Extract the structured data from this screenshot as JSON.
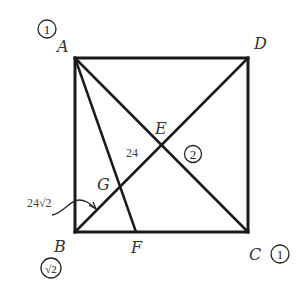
{
  "diagram": {
    "stroke_color": "#1a1a1a",
    "points": {
      "A": {
        "label": "A",
        "x": 75,
        "y": 58
      },
      "D": {
        "label": "D",
        "x": 248,
        "y": 58
      },
      "B": {
        "label": "B",
        "x": 75,
        "y": 232
      },
      "C": {
        "label": "C",
        "x": 248,
        "y": 232
      },
      "E": {
        "label": "E",
        "x": 161,
        "y": 145
      },
      "F": {
        "label": "F",
        "x": 136,
        "y": 232
      },
      "G": {
        "label": "G",
        "x": 120,
        "y": 187
      }
    },
    "segments": [
      [
        "A",
        "D"
      ],
      [
        "D",
        "C"
      ],
      [
        "C",
        "B"
      ],
      [
        "B",
        "A"
      ],
      [
        "A",
        "C"
      ],
      [
        "B",
        "D"
      ],
      [
        "A",
        "F"
      ]
    ],
    "annotations": {
      "segment_EG_length": "24",
      "segment_BG_length": "24√2",
      "circled_A": "1",
      "circled_C": "1",
      "circled_E": "2",
      "circled_B": "√2"
    }
  }
}
